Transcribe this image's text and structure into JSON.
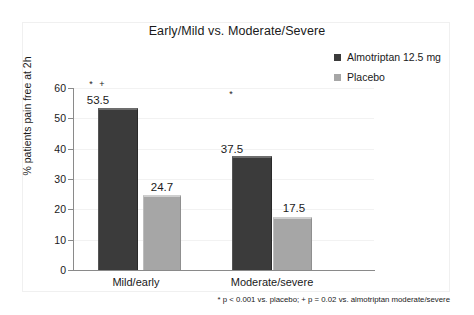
{
  "chart_data": {
    "type": "bar",
    "title": "Early/Mild vs. Moderate/Severe",
    "xlabel": "",
    "ylabel": "% patients pain free at 2h",
    "ylim": [
      0,
      60
    ],
    "yticks": [
      0,
      10,
      20,
      30,
      40,
      50,
      60
    ],
    "ytick_labels": [
      "0",
      "10",
      "20",
      "30",
      "40",
      "50",
      "60"
    ],
    "grid": true,
    "legend_position": "top-right",
    "categories": [
      "Mild/early",
      "Moderate/severe"
    ],
    "series": [
      {
        "name": "Almotriptan 12.5 mg",
        "color": "#3b3b3b",
        "values": [
          53.5,
          37.5
        ],
        "value_labels": [
          "53.5",
          "37.5"
        ],
        "markers": [
          "* +",
          "*"
        ]
      },
      {
        "name": "Placebo",
        "color": "#a6a6a6",
        "values": [
          24.7,
          17.5
        ],
        "value_labels": [
          "24.7",
          "17.5"
        ],
        "markers": [
          "",
          ""
        ]
      }
    ],
    "annotations": {
      "footnote": "* p < 0.001 vs. placebo; + p = 0.02 vs. almotriptan moderate/severe"
    }
  },
  "legend": {
    "items": [
      {
        "label": "Almotriptan 12.5 mg",
        "color": "#3b3b3b"
      },
      {
        "label": "Placebo",
        "color": "#a6a6a6"
      }
    ]
  }
}
